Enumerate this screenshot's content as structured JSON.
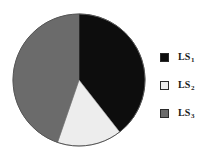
{
  "chart_data": {
    "type": "pie",
    "title": "",
    "subtitle": "",
    "xlabel": "",
    "ylabel": "",
    "grid": false,
    "legend_position": "right",
    "categories": [
      "LS1",
      "LS2",
      "LS3"
    ],
    "values": [
      39,
      16,
      45
    ],
    "slices": [
      {
        "label": "LS",
        "subscript": "1",
        "value": 39,
        "color": "#0d0d0d",
        "start_angle_deg": 0,
        "end_angle_deg": 142
      },
      {
        "label": "LS",
        "subscript": "2",
        "value": 16,
        "color": "#ededed",
        "start_angle_deg": 142,
        "end_angle_deg": 199
      },
      {
        "label": "LS",
        "subscript": "3",
        "value": 45,
        "color": "#6b6b6b",
        "start_angle_deg": 199,
        "end_angle_deg": 360
      }
    ],
    "center_x": 67,
    "center_y": 68,
    "radius": 66,
    "outline_color": "#555555",
    "background": "#ffffff"
  },
  "legend": {
    "entries": [
      {
        "label": "LS",
        "subscript": "1",
        "color": "#0d0d0d"
      },
      {
        "label": "LS",
        "subscript": "2",
        "color": "#ededed"
      },
      {
        "label": "LS",
        "subscript": "3",
        "color": "#6b6b6b"
      }
    ]
  }
}
